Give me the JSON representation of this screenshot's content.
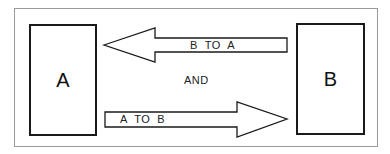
{
  "diagram": {
    "node_a": "A",
    "node_b": "B",
    "arrow_top_label": "B  TO  A",
    "arrow_bottom_label": "A  TO  B",
    "connector_text": "AND"
  },
  "colors": {
    "stroke": "#1a1a1a",
    "frame": "#9a9a9a",
    "background": "#ffffff"
  }
}
